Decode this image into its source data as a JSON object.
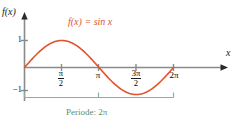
{
  "figure": {
    "background_color": "#ffffff",
    "width": 243,
    "height": 127
  },
  "axes": {
    "y_axis_label": "f(x)",
    "x_axis_label": "x",
    "axis_color": "#8a8a8a"
  },
  "labels": {
    "function_label": "f(x) = sin x",
    "function_label_color": "#E0532E",
    "period_label": "Periode: 2π",
    "period_label_color": "#5E8A70"
  },
  "y_ticks": [
    {
      "label": "1"
    },
    {
      "label": "−1"
    }
  ],
  "x_ticks": [
    {
      "numerator": "π",
      "denominator": "2",
      "is_fraction": true
    },
    {
      "label": "π",
      "is_fraction": false
    },
    {
      "numerator": "3π",
      "denominator": "2",
      "is_fraction": true
    },
    {
      "label": "2π",
      "is_fraction": false
    }
  ],
  "chart_data": {
    "type": "line",
    "title": "",
    "subtitle": "",
    "xlabel": "x",
    "ylabel": "f(x)",
    "xlim": [
      0,
      6.2831853
    ],
    "ylim": [
      -1,
      1
    ],
    "grid": false,
    "legend_position": "inside-top",
    "series": [
      {
        "name": "f(x) = sin x",
        "color": "#E0532E",
        "line_width": 1.6,
        "x": [
          0,
          0.3926991,
          0.7853982,
          1.1780972,
          1.5707963,
          1.9634954,
          2.3561945,
          2.7488936,
          3.1415927,
          3.5342917,
          3.9269908,
          4.3196899,
          4.712389,
          5.1050881,
          5.4977871,
          5.8904862,
          6.2831853
        ],
        "values": [
          0,
          0.3827,
          0.7071,
          0.9239,
          1.0,
          0.9239,
          0.7071,
          0.3827,
          0,
          -0.3827,
          -0.7071,
          -0.9239,
          -1.0,
          -0.9239,
          -0.7071,
          -0.3827,
          0
        ]
      }
    ],
    "x_tick_values": [
      1.5707963,
      3.1415927,
      4.712389,
      6.2831853
    ],
    "x_tick_labels": [
      "π/2",
      "π",
      "3π/2",
      "2π"
    ],
    "y_tick_values": [
      1,
      -1
    ],
    "y_tick_labels": [
      "1",
      "−1"
    ],
    "annotations": [
      {
        "type": "span-bracket",
        "text": "Periode: 2π",
        "from_x": 0,
        "to_x": 6.2831853,
        "color": "#5E8A70"
      },
      {
        "type": "curve-label",
        "text": "f(x) = sin x",
        "color": "#E0532E"
      }
    ]
  }
}
